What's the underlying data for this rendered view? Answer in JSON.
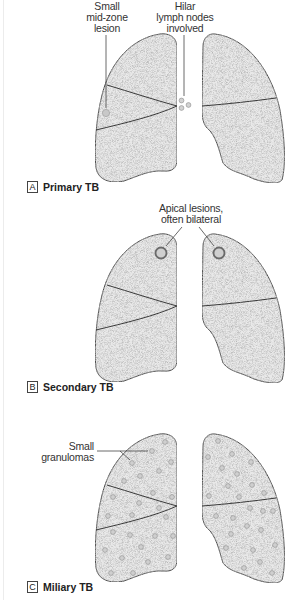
{
  "figure": {
    "panels": [
      {
        "letter": "A",
        "title": "Primary TB",
        "callouts": [
          {
            "text_lines": [
              "Small",
              "mid-zone",
              "lesion"
            ]
          },
          {
            "text_lines": [
              "Hilar",
              "lymph nodes",
              "involved"
            ]
          }
        ]
      },
      {
        "letter": "B",
        "title": "Secondary TB",
        "callouts": [
          {
            "text_lines": [
              "Apical lesions,",
              "often bilateral"
            ]
          }
        ]
      },
      {
        "letter": "C",
        "title": "Miliary TB",
        "callouts": [
          {
            "text_lines": [
              "Small",
              "granulomas"
            ]
          }
        ]
      }
    ],
    "colors": {
      "lung_fill": "#e9e9e9",
      "outline": "#4a4a4a",
      "lesion_fill": "#c8c8c8",
      "apical_ring": "#6a6a6a"
    }
  }
}
